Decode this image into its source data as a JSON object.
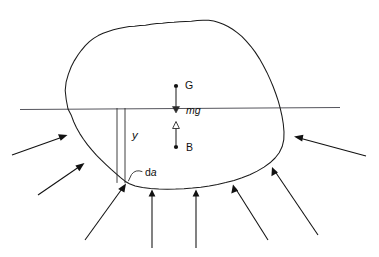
{
  "figure": {
    "background_color": "#ffffff",
    "ink_color": "#111111",
    "waterline_color": "#55555c",
    "width": 379,
    "height": 257
  },
  "labels": {
    "center_of_gravity": "G",
    "weight_force": "mg",
    "center_of_buoyancy": "B",
    "depth": "y",
    "element_area_d": "d",
    "element_area_a": "a"
  },
  "annotations": [
    {
      "name": "center-of-gravity-point",
      "label": "G",
      "x": 176,
      "y": 86,
      "kind": "point"
    },
    {
      "name": "weight-force-vector",
      "label": "mg",
      "direction": "down",
      "from_y": 86,
      "to_y": 112,
      "x": 176,
      "kind": "force"
    },
    {
      "name": "buoyancy-force-vector",
      "label": "",
      "direction": "up",
      "from_y": 147,
      "to_y": 122,
      "x": 176,
      "kind": "force"
    },
    {
      "name": "center-of-buoyancy-point",
      "label": "B",
      "x": 176,
      "y": 147,
      "kind": "point"
    },
    {
      "name": "depth-dimension",
      "label": "y",
      "x": 134,
      "y": 136,
      "kind": "dimension"
    },
    {
      "name": "area-element-callout",
      "label": "da",
      "x": 145,
      "y": 173,
      "kind": "callout"
    }
  ],
  "geometry": {
    "waterline": {
      "x1": 20,
      "y1": 109.5,
      "x2": 340,
      "y2": 107.5
    },
    "body_outline": "M 68,109 L 66,99 L 65,90 L 66,82 L 68,74 L 71,66 L 74,60 L 78,54 L 81,50 L 85,45 L 89,41 L 93,38 L 98,35 L 103,33 L 108,31 L 113,29 L 118,28 L 123,27 L 129,26 L 134,26 L 140,25 L 146,25 L 152,24 L 158,23 L 164,23 L 170,22 L 176,22 L 182,21 L 188,21 L 194,21 L 200,20 L 206,20 L 212,20 L 217,21 L 222,22 L 227,24 L 232,26 L 237,29 L 242,32 L 247,36 L 252,41 L 257,46 L 262,52 L 267,59 L 271,66 L 275,73 L 279,81 L 282,88 L 285,95 L 288,102 L 290,109 L 292,117 L 293,125 L 294,133 L 293,141 L 291,148 L 288,154 L 284,159 L 279,164 L 273,168 L 266,172 L 258,176 L 250,179 L 242,182 L 234,184 L 226,186 L 218,188 L 210,189 L 202,190 L 194,190 L 186,191 L 178,191 L 170,191 L 162,191 L 154,190 L 146,189 L 139,187 L 133,185 L 128,182 L 123,178 L 118,174 L 113,170 L 108,166 L 103,161 L 98,156 L 93,151 L 88,146 L 83,140 L 79,134 L 75,128 L 72,122 L 70,116 L 68,109 Z",
    "depth_lines": [
      {
        "x": 117,
        "y1": 108,
        "y2": 183
      },
      {
        "x": 125,
        "y1": 108,
        "y2": 183
      }
    ],
    "callout_leader": "M 141,171 Q 135,169 131,175 L 128,181",
    "pressure_arrows": [
      {
        "name": "pressure-arrow-left-upper",
        "x1": 12,
        "y1": 155,
        "x2": 66,
        "y2": 135
      },
      {
        "name": "pressure-arrow-left-lower",
        "x1": 38,
        "y1": 195,
        "x2": 83,
        "y2": 164
      },
      {
        "name": "pressure-arrow-bottom-left",
        "x1": 85,
        "y1": 240,
        "x2": 125,
        "y2": 185
      },
      {
        "name": "pressure-arrow-bottom-center-left",
        "x1": 152,
        "y1": 248,
        "x2": 152,
        "y2": 193
      },
      {
        "name": "pressure-arrow-bottom-center-right",
        "x1": 196,
        "y1": 248,
        "x2": 196,
        "y2": 193
      },
      {
        "name": "pressure-arrow-bottom-right",
        "x1": 268,
        "y1": 240,
        "x2": 233,
        "y2": 185
      },
      {
        "name": "pressure-arrow-right-lower",
        "x1": 318,
        "y1": 235,
        "x2": 272,
        "y2": 167
      },
      {
        "name": "pressure-arrow-right-upper",
        "x1": 366,
        "y1": 156,
        "x2": 294,
        "y2": 136
      }
    ]
  }
}
